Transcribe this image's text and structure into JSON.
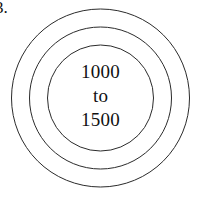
{
  "figure": {
    "item_label": "3.",
    "background_color": "#ffffff",
    "stroke_color": "#2b2b2b",
    "text_color": "#111111"
  },
  "diagram": {
    "type": "concentric-circles",
    "center": {
      "x": 100.5,
      "y": 98
    },
    "rings": [
      {
        "name": "outer-circle",
        "radius": 89
      },
      {
        "name": "middle-circle",
        "radius": 71
      },
      {
        "name": "inner-circle",
        "radius": 53
      }
    ]
  },
  "center_label": {
    "line1": "1000",
    "line2": "to",
    "line3": "1500"
  }
}
